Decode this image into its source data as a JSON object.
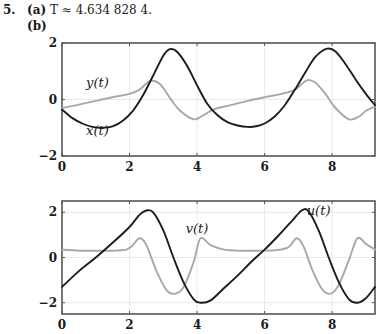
{
  "header": {
    "problem_number": "5.",
    "part_a_label": "(a)",
    "part_a_text": "T ≈ 4.634 828 4.",
    "part_b_label": "(b)"
  },
  "colors": {
    "dark_curve": "#1c1c1c",
    "light_curve": "#a8a8a8",
    "axis": "#555555",
    "grid": "#e4e4e4"
  },
  "chart_data": [
    {
      "type": "line",
      "title": "",
      "xlabel": "",
      "ylabel": "",
      "xlim": [
        0,
        9.27
      ],
      "ylim": [
        -2,
        2
      ],
      "xticks": [
        0,
        2,
        4,
        6,
        8
      ],
      "yticks": [
        -2,
        0,
        2
      ],
      "grid": true,
      "annotations": [
        {
          "text": "y(t)",
          "x": 1.05,
          "y": 0.45
        },
        {
          "text": "x(t)",
          "x": 1.05,
          "y": -1.25
        }
      ],
      "series": [
        {
          "name": "x(t)",
          "color": "dark",
          "x": [
            0,
            0.3,
            0.6,
            0.9,
            1.2,
            1.5,
            1.8,
            2.1,
            2.4,
            2.7,
            3.0,
            3.2,
            3.4,
            3.7,
            4.0,
            4.3,
            4.6,
            4.9,
            5.2,
            5.5,
            5.75,
            6.0,
            6.3,
            6.6,
            6.9,
            7.2,
            7.5,
            7.85,
            8.1,
            8.4,
            8.7,
            9.0,
            9.27
          ],
          "y": [
            -0.35,
            -0.65,
            -0.85,
            -0.97,
            -1.0,
            -0.95,
            -0.75,
            -0.4,
            0.15,
            0.85,
            1.55,
            1.78,
            1.7,
            1.2,
            0.5,
            -0.15,
            -0.55,
            -0.8,
            -0.92,
            -0.97,
            -0.95,
            -0.85,
            -0.6,
            -0.2,
            0.35,
            0.95,
            1.5,
            1.8,
            1.7,
            1.25,
            0.7,
            0.2,
            -0.2
          ]
        },
        {
          "name": "y(t)",
          "color": "light",
          "x": [
            0,
            0.5,
            1.0,
            1.5,
            2.0,
            2.3,
            2.6,
            2.9,
            3.2,
            3.5,
            3.9,
            4.2,
            4.5,
            5.0,
            5.5,
            6.0,
            6.5,
            6.9,
            7.25,
            7.5,
            7.8,
            8.1,
            8.5,
            8.8,
            9.0,
            9.27
          ],
          "y": [
            -0.3,
            -0.18,
            -0.05,
            0.08,
            0.2,
            0.35,
            0.65,
            0.55,
            0.05,
            -0.4,
            -0.7,
            -0.55,
            -0.35,
            -0.2,
            -0.05,
            0.08,
            0.2,
            0.35,
            0.68,
            0.6,
            0.2,
            -0.3,
            -0.7,
            -0.6,
            -0.4,
            -0.25
          ]
        }
      ]
    },
    {
      "type": "line",
      "title": "",
      "xlabel": "",
      "ylabel": "",
      "xlim": [
        0,
        9.27
      ],
      "ylim": [
        -2.5,
        2.5
      ],
      "xticks": [
        0,
        2,
        4,
        6,
        8
      ],
      "yticks": [
        -2,
        0,
        2
      ],
      "grid": true,
      "annotations": [
        {
          "text": "v(t)",
          "x": 4.0,
          "y": 1.1
        },
        {
          "text": "u(t)",
          "x": 7.6,
          "y": 1.9
        }
      ],
      "series": [
        {
          "name": "u(t)",
          "color": "dark",
          "x": [
            0,
            0.5,
            1.0,
            1.5,
            2.0,
            2.3,
            2.5,
            2.7,
            3.0,
            3.3,
            3.6,
            3.9,
            4.1,
            4.4,
            4.8,
            5.2,
            5.6,
            6.0,
            6.4,
            6.8,
            7.1,
            7.3,
            7.6,
            7.9,
            8.2,
            8.5,
            8.75,
            9.0,
            9.27
          ],
          "y": [
            -1.3,
            -0.6,
            0.0,
            0.65,
            1.35,
            1.9,
            2.08,
            2.0,
            1.2,
            0.0,
            -1.1,
            -1.85,
            -2.0,
            -1.9,
            -1.35,
            -0.8,
            -0.2,
            0.35,
            0.95,
            1.6,
            2.08,
            2.05,
            1.2,
            0.0,
            -1.1,
            -1.85,
            -2.0,
            -1.8,
            -1.3
          ]
        },
        {
          "name": "v(t)",
          "color": "light",
          "x": [
            0,
            0.5,
            1.0,
            1.5,
            1.9,
            2.1,
            2.3,
            2.5,
            2.8,
            3.1,
            3.35,
            3.6,
            3.9,
            4.1,
            4.4,
            4.8,
            5.3,
            5.8,
            6.3,
            6.7,
            6.95,
            7.15,
            7.4,
            7.7,
            7.95,
            8.2,
            8.5,
            8.75,
            9.0,
            9.27
          ],
          "y": [
            0.35,
            0.3,
            0.3,
            0.3,
            0.35,
            0.55,
            0.85,
            0.55,
            -0.6,
            -1.45,
            -1.6,
            -1.3,
            -0.2,
            0.85,
            0.55,
            0.35,
            0.3,
            0.3,
            0.32,
            0.45,
            0.85,
            0.5,
            -0.5,
            -1.4,
            -1.6,
            -1.2,
            -0.1,
            0.85,
            0.6,
            0.35
          ]
        }
      ]
    }
  ]
}
